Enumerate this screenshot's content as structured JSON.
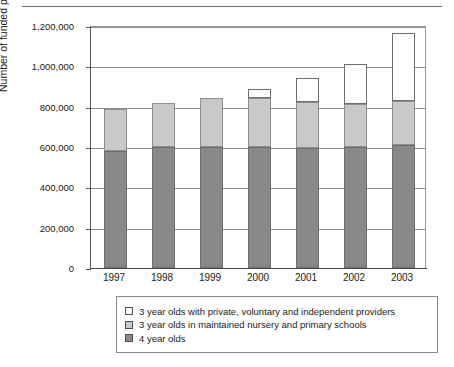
{
  "chart_data": {
    "type": "bar",
    "stacked": true,
    "title": "",
    "xlabel": "",
    "ylabel": "Number of funded places",
    "categories": [
      "1997",
      "1998",
      "1999",
      "2000",
      "2001",
      "2002",
      "2003"
    ],
    "ylim": [
      0,
      1200000
    ],
    "yticks": [
      0,
      200000,
      400000,
      600000,
      800000,
      1000000,
      1200000
    ],
    "ytick_labels": [
      "0",
      "200,000",
      "400,000",
      "600,000",
      "800,000",
      "1,000,000",
      "1,200,000"
    ],
    "grid": true,
    "legend_position": "bottom",
    "series": [
      {
        "name": "4 year olds",
        "color": "#888888",
        "values": [
          580000,
          600000,
          602000,
          602000,
          595000,
          602000,
          610000
        ]
      },
      {
        "name": "3 year olds in maintained nursery and primary schools",
        "color": "#c9c9c9",
        "values": [
          210000,
          220000,
          243000,
          243000,
          230000,
          213000,
          220000
        ]
      },
      {
        "name": "3 year olds with private, voluntary and independent providers",
        "color": "#ffffff",
        "values": [
          0,
          0,
          0,
          43000,
          115000,
          195000,
          335000
        ]
      }
    ],
    "totals": [
      790000,
      820000,
      845000,
      888000,
      940000,
      1010000,
      1165000
    ]
  },
  "legend": {
    "items": [
      {
        "label": "3 year olds with private, voluntary and independent providers",
        "swatch": "white"
      },
      {
        "label": "3 year olds in maintained nursery and primary schools",
        "swatch": "light"
      },
      {
        "label": "4 year olds",
        "swatch": "dark"
      }
    ]
  }
}
